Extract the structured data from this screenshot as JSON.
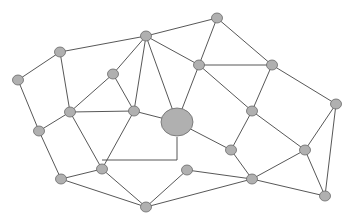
{
  "diagram": {
    "type": "network-graph",
    "colors": {
      "node_fill": "#b0b0b0",
      "node_stroke": "#6a6a6a",
      "edge": "#444444",
      "background": "#ffffff"
    },
    "nodes": [
      {
        "id": "A",
        "x": 217,
        "y": 18,
        "r": 5
      },
      {
        "id": "B",
        "x": 146,
        "y": 36,
        "r": 5
      },
      {
        "id": "C",
        "x": 60,
        "y": 52,
        "r": 5
      },
      {
        "id": "D",
        "x": 18,
        "y": 80,
        "r": 5
      },
      {
        "id": "E",
        "x": 113,
        "y": 74,
        "r": 5
      },
      {
        "id": "F",
        "x": 199,
        "y": 65,
        "r": 5
      },
      {
        "id": "G",
        "x": 272,
        "y": 65,
        "r": 5
      },
      {
        "id": "H",
        "x": 336,
        "y": 104,
        "r": 5
      },
      {
        "id": "I",
        "x": 70,
        "y": 112,
        "r": 5
      },
      {
        "id": "J",
        "x": 134,
        "y": 111,
        "r": 5
      },
      {
        "id": "K",
        "x": 177,
        "y": 122,
        "r": 15,
        "hub": true
      },
      {
        "id": "L",
        "x": 252,
        "y": 111,
        "r": 5
      },
      {
        "id": "M",
        "x": 39,
        "y": 131,
        "r": 5
      },
      {
        "id": "N",
        "x": 231,
        "y": 150,
        "r": 5
      },
      {
        "id": "O",
        "x": 305,
        "y": 150,
        "r": 5
      },
      {
        "id": "P",
        "x": 102,
        "y": 169,
        "r": 5
      },
      {
        "id": "Q",
        "x": 187,
        "y": 170,
        "r": 5
      },
      {
        "id": "R",
        "x": 252,
        "y": 179,
        "r": 5
      },
      {
        "id": "S",
        "x": 61,
        "y": 179,
        "r": 5
      },
      {
        "id": "T",
        "x": 146,
        "y": 207,
        "r": 5
      },
      {
        "id": "U",
        "x": 325,
        "y": 196,
        "r": 5
      }
    ],
    "edges": [
      [
        "A",
        "B"
      ],
      [
        "A",
        "F"
      ],
      [
        "A",
        "G"
      ],
      [
        "B",
        "C"
      ],
      [
        "B",
        "E"
      ],
      [
        "B",
        "J"
      ],
      [
        "B",
        "K"
      ],
      [
        "B",
        "F"
      ],
      [
        "C",
        "D"
      ],
      [
        "C",
        "I"
      ],
      [
        "D",
        "M"
      ],
      [
        "E",
        "I"
      ],
      [
        "E",
        "J"
      ],
      [
        "I",
        "J"
      ],
      [
        "I",
        "P"
      ],
      [
        "I",
        "M"
      ],
      [
        "M",
        "S"
      ],
      [
        "J",
        "P"
      ],
      [
        "J",
        "K"
      ],
      [
        "F",
        "G"
      ],
      [
        "F",
        "K"
      ],
      [
        "F",
        "L"
      ],
      [
        "G",
        "L"
      ],
      [
        "G",
        "H"
      ],
      [
        "K",
        "N"
      ],
      [
        "L",
        "N"
      ],
      [
        "L",
        "O"
      ],
      [
        "H",
        "O"
      ],
      [
        "H",
        "U"
      ],
      [
        "N",
        "R"
      ],
      [
        "O",
        "R"
      ],
      [
        "O",
        "U"
      ],
      [
        "R",
        "U"
      ],
      [
        "P",
        "T"
      ],
      [
        "S",
        "P"
      ],
      [
        "S",
        "T"
      ],
      [
        "P",
        "K_corner"
      ],
      [
        "Q",
        "R"
      ],
      [
        "Q",
        "T"
      ],
      [
        "R",
        "T"
      ]
    ],
    "corner_points": {
      "K_corner": {
        "x": 177,
        "y": 161
      }
    },
    "polyline_edges": [
      {
        "points": [
          [
            102,
            160
          ],
          [
            177,
            160
          ],
          [
            177,
            137
          ]
        ]
      }
    ]
  }
}
